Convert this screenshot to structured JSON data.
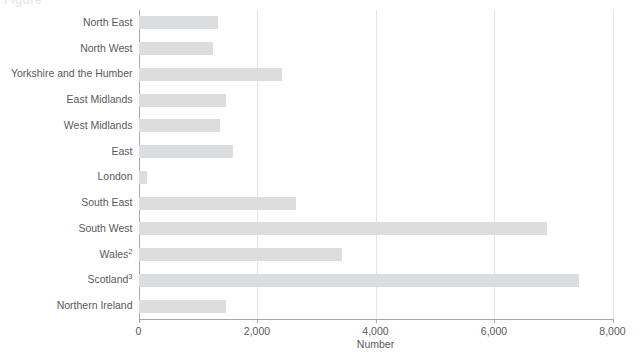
{
  "chart_data": {
    "type": "bar",
    "orientation": "horizontal",
    "title": "Figure",
    "xlabel": "Number",
    "ylabel": "",
    "xlim": [
      0,
      8000
    ],
    "xticks": [
      0,
      2000,
      4000,
      6000,
      8000
    ],
    "xtick_labels": [
      "0",
      "2,000",
      "4,000",
      "6,000",
      "8,000"
    ],
    "grid": "vertical",
    "legend": "none",
    "bar_color": "#dcdddf",
    "axis_color": "#a6a8ab",
    "text_color": "#58595b",
    "categories": [
      "North East",
      "North West",
      "Yorkshire and the Humber",
      "East Midlands",
      "West Midlands",
      "East",
      "London",
      "South East",
      "South West",
      "Wales",
      "Scotland",
      "Northern Ireland"
    ],
    "category_footnotes": {
      "Wales": "2",
      "Scotland": "3"
    },
    "values": [
      1340,
      1250,
      2430,
      1470,
      1370,
      1590,
      140,
      2650,
      6900,
      3430,
      7430,
      1480
    ]
  }
}
